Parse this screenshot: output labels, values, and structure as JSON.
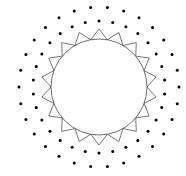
{
  "diagram": {
    "type": "sun-pattern",
    "center": [
      99,
      87
    ],
    "colors": {
      "background": "#ffffff",
      "stroke": "#555555",
      "dot": "#000000"
    },
    "circle": {
      "radius": 48
    },
    "rays": {
      "count": 18,
      "inner_radius": 48,
      "outer_radius": 58,
      "rotation_deg": 0
    },
    "dot_rings": [
      {
        "count": 30,
        "radius": 66,
        "dot_radius": 1.5,
        "offset_deg": 0
      },
      {
        "count": 30,
        "radius": 80,
        "dot_radius": 1.5,
        "offset_deg": 6
      }
    ]
  }
}
